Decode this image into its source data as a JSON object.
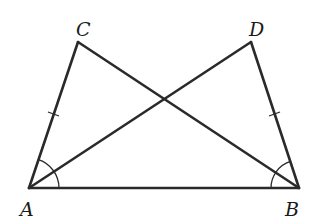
{
  "diagram": {
    "points": {
      "A": {
        "label": "A",
        "x": 29,
        "y": 188
      },
      "B": {
        "label": "B",
        "x": 299,
        "y": 188
      },
      "C": {
        "label": "C",
        "x": 78,
        "y": 42
      },
      "D": {
        "label": "D",
        "x": 251,
        "y": 42
      }
    },
    "labels": {
      "A": "A",
      "B": "B",
      "C": "C",
      "D": "D"
    },
    "segments": [
      "AB",
      "AC",
      "AD",
      "BC",
      "BD"
    ],
    "equal_marks": [
      "AC",
      "BD"
    ],
    "angle_marks": [
      "CAB",
      "DBA"
    ],
    "colors": {
      "line": "#2a2a2a",
      "background": "#ffffff"
    }
  }
}
